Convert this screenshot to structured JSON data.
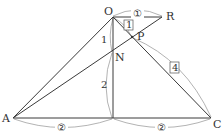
{
  "diagram": {
    "points": {
      "O": {
        "label": "O",
        "x": 113,
        "y": 17
      },
      "R": {
        "label": "R",
        "x": 162,
        "y": 17
      },
      "P": {
        "label": "P",
        "x": 132,
        "y": 37
      },
      "N": {
        "label": "N",
        "x": 113,
        "y": 52
      },
      "A": {
        "label": "A",
        "x": 13,
        "y": 118
      },
      "C": {
        "label": "C",
        "x": 211,
        "y": 118
      },
      "M": {
        "label": "",
        "x": 113,
        "y": 118
      }
    },
    "segments": [
      [
        "O",
        "R"
      ],
      [
        "O",
        "A"
      ],
      [
        "O",
        "C"
      ],
      [
        "A",
        "C"
      ],
      [
        "O",
        "M"
      ],
      [
        "A",
        "R"
      ]
    ],
    "annotations": {
      "OR": "①",
      "OP": "1",
      "PC": "4",
      "ON": "1",
      "NM": "2",
      "AM": "②",
      "MC": "②"
    },
    "line_color": "#3a3a3a",
    "arc_color": "#9a9a9a"
  }
}
